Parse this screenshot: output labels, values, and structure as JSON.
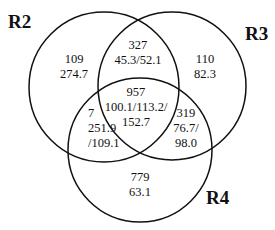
{
  "sets": [
    {
      "name": "R2"
    },
    {
      "name": "R3"
    },
    {
      "name": "R4"
    }
  ],
  "regions": {
    "r2_only": {
      "count": "109",
      "values": [
        "274.7"
      ]
    },
    "r3_only": {
      "count": "110",
      "values": [
        "82.3"
      ]
    },
    "r4_only": {
      "count": "779",
      "values": [
        "63.1"
      ]
    },
    "r2_r3": {
      "count": "327",
      "values": [
        "45.3/52.1"
      ]
    },
    "r2_r4": {
      "count": "7",
      "values": [
        "251.9",
        "/109.1"
      ]
    },
    "r3_r4": {
      "count": "319",
      "values": [
        "76.7/",
        "98.0"
      ]
    },
    "r2_r3_r4": {
      "count": "957",
      "values": [
        "100.1/113.2/",
        "152.7"
      ]
    }
  }
}
